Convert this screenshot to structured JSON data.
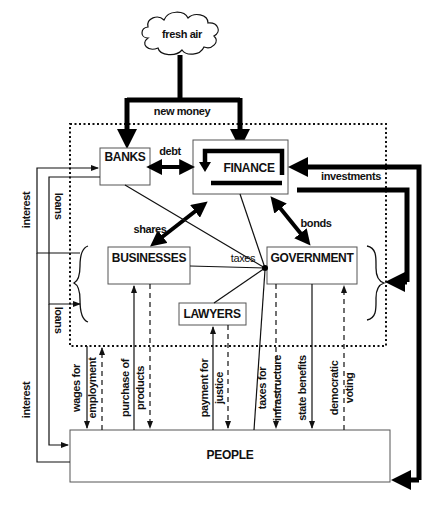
{
  "diagram": {
    "source": {
      "label": "fresh air",
      "flow_label": "new money"
    },
    "nodes": {
      "banks": "BANKS",
      "finance": "FINANCE",
      "businesses": "BUSINESSES",
      "government": "GOVERNMENT",
      "lawyers": "LAWYERS",
      "people": "PEOPLE"
    },
    "edges": {
      "debt": "debt",
      "shares": "shares",
      "bonds": "bonds",
      "investments": "investments",
      "taxes": "taxes",
      "interest_upper": "interest",
      "loans_upper": "loans",
      "interest_lower": "interest",
      "loans_lower": "loans"
    },
    "people_flows": {
      "wages_1": "wages for",
      "wages_2": "employment",
      "purchase_1": "purchase of",
      "purchase_2": "products",
      "payment_1": "payment for",
      "payment_2": "justice",
      "taxes_infra_1": "taxes for",
      "taxes_infra_2": "infrastructure",
      "state_benefits": "state benefits",
      "democratic_1": "democratic",
      "democratic_2": "voting"
    },
    "colors": {
      "ink": "#111111",
      "box_border": "#555555",
      "background": "#ffffff"
    }
  }
}
